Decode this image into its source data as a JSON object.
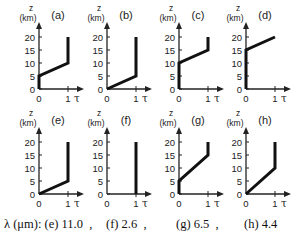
{
  "figure": {
    "axis": {
      "y_title_line1": "z",
      "y_title_line2": "(km)",
      "y_ticks": [
        "20",
        "15",
        "10",
        "5",
        "0"
      ],
      "x_ticks": [
        "0",
        "1"
      ],
      "x_symbol": "τ"
    },
    "panels": [
      {
        "label": "(a)",
        "points": [
          [
            0,
            0
          ],
          [
            0,
            5
          ],
          [
            1,
            10
          ],
          [
            1,
            20
          ]
        ]
      },
      {
        "label": "(b)",
        "points": [
          [
            0,
            0
          ],
          [
            1,
            5
          ],
          [
            1,
            20
          ]
        ]
      },
      {
        "label": "(c)",
        "points": [
          [
            0,
            0
          ],
          [
            0,
            10
          ],
          [
            1,
            15
          ],
          [
            1,
            20
          ]
        ]
      },
      {
        "label": "(d)",
        "points": [
          [
            0,
            0
          ],
          [
            0,
            15
          ],
          [
            1,
            20
          ]
        ]
      },
      {
        "label": "(e)",
        "points": [
          [
            0,
            0
          ],
          [
            1,
            5
          ],
          [
            1,
            20
          ]
        ]
      },
      {
        "label": "(f)",
        "points": [
          [
            1,
            0
          ],
          [
            1,
            20
          ]
        ]
      },
      {
        "label": "(g)",
        "points": [
          [
            0,
            0
          ],
          [
            0,
            5
          ],
          [
            1,
            15
          ],
          [
            1,
            20
          ]
        ]
      },
      {
        "label": "(h)",
        "points": [
          [
            0,
            0
          ],
          [
            1,
            10
          ],
          [
            1,
            20
          ]
        ]
      }
    ]
  },
  "caption": {
    "prefix": "λ (μm): (e) 11.0  ,",
    "f": "(f) 2.6  ,",
    "g": "(g) 6.5  ,",
    "h": "(h) 4.4"
  },
  "colors": {
    "line": "#111111",
    "axis": "#222222"
  }
}
